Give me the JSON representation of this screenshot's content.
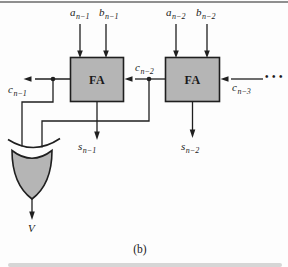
{
  "caption": "(b)",
  "gates": {
    "fa1": {
      "label": "FA"
    },
    "fa2": {
      "label": "FA"
    }
  },
  "labels": {
    "a_n1": {
      "base": "a",
      "sub": "n−1"
    },
    "b_n1": {
      "base": "b",
      "sub": "n−1"
    },
    "a_n2": {
      "base": "a",
      "sub": "n−2"
    },
    "b_n2": {
      "base": "b",
      "sub": "n−2"
    },
    "c_n1": {
      "base": "c",
      "sub": "n−1"
    },
    "c_n2": {
      "base": "c",
      "sub": "n−2"
    },
    "c_n3": {
      "base": "c",
      "sub": "n−3"
    },
    "s_n1": {
      "base": "s",
      "sub": "n−1"
    },
    "s_n2": {
      "base": "s",
      "sub": "n−2"
    },
    "v": {
      "base": "V",
      "sub": ""
    },
    "ellipsis": "•••"
  },
  "colors": {
    "background": "#fdfdfd",
    "line": "#1f1f1f",
    "box_fill": "#b5b5b5",
    "top_rule": "#8f8f8f",
    "bottom_band": "#d6d6d6",
    "text": "#1a1a1a"
  }
}
